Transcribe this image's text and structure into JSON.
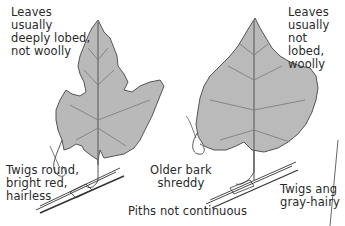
{
  "diagram": {
    "left_leaf": {
      "description": [
        "Leaves",
        "usually",
        "deeply lobed,",
        "not woolly"
      ],
      "twigs": [
        "Twigs round,",
        "bright red,",
        "hairless"
      ]
    },
    "right_leaf": {
      "description": [
        "Leaves",
        "usually",
        "not lobed,",
        "woolly"
      ],
      "twigs": [
        "Twigs ang",
        "gray-hairy"
      ]
    },
    "center": {
      "bark": [
        "Older bark",
        "shreddy"
      ],
      "pith": "Piths not continuous"
    },
    "colors": {
      "leaf_fill": "#b9b9b9",
      "leaf_outline": "#555555",
      "text": "#2a2a2a",
      "background": "#ffffff"
    }
  }
}
